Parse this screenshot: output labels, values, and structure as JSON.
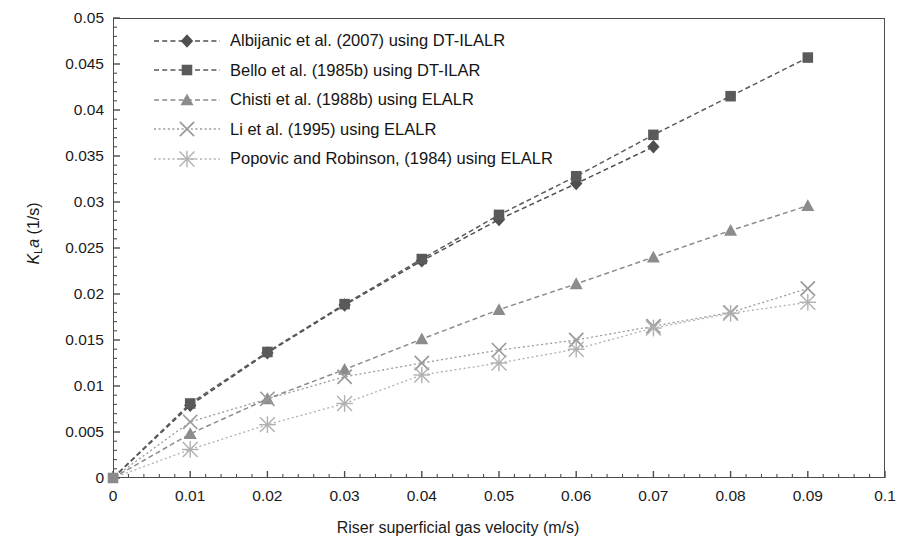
{
  "chart_data": {
    "type": "line",
    "title": "",
    "xlabel": "Riser superficial gas velocity (m/s)",
    "ylabel": "KLa (1/s)",
    "ylabel_parts": {
      "italic1": "K",
      "sub": "L",
      "italic2": "a",
      "unit": " (1/s)"
    },
    "xlim": [
      0,
      0.1
    ],
    "ylim": [
      0,
      0.05
    ],
    "xticks": [
      0,
      0.01,
      0.02,
      0.03,
      0.04,
      0.05,
      0.06,
      0.07,
      0.08,
      0.09,
      0.1
    ],
    "xtick_labels": [
      "0",
      "0.01",
      "0.02",
      "0.03",
      "0.04",
      "0.05",
      "0.06",
      "0.07",
      "0.08",
      "0.09",
      "0.1"
    ],
    "yticks": [
      0,
      0.005,
      0.01,
      0.015,
      0.02,
      0.025,
      0.03,
      0.035,
      0.04,
      0.045,
      0.05
    ],
    "ytick_labels": [
      "0",
      "0.005",
      "0.01",
      "0.015",
      "0.02",
      "0.025",
      "0.03",
      "0.035",
      "0.04",
      "0.045",
      "0.05"
    ],
    "x_minor_ticks_per_major": 5,
    "y_minor_ticks_per_major": 5,
    "grid": false,
    "legend_position": "top-left-inside",
    "series": [
      {
        "name": "Albijanic et al. (2007) using DT-ILALR",
        "marker": "diamond",
        "color": "#4f4f4f",
        "line": "dashed",
        "x": [
          0,
          0.01,
          0.02,
          0.03,
          0.04,
          0.05,
          0.06,
          0.07
        ],
        "y": [
          0,
          0.0079,
          0.0136,
          0.0188,
          0.0236,
          0.0281,
          0.032,
          0.036
        ]
      },
      {
        "name": "Bello et al. (1985b) using DT-ILAR",
        "marker": "square",
        "color": "#5a5a5a",
        "line": "dashed",
        "x": [
          0,
          0.01,
          0.02,
          0.03,
          0.04,
          0.05,
          0.06,
          0.07,
          0.08,
          0.09
        ],
        "y": [
          0,
          0.0081,
          0.0137,
          0.0189,
          0.0238,
          0.0286,
          0.0328,
          0.0373,
          0.0415,
          0.0457
        ]
      },
      {
        "name": "Chisti et al. (1988b) using ELALR",
        "marker": "triangle",
        "color": "#8c8c8c",
        "line": "dashed",
        "x": [
          0,
          0.01,
          0.02,
          0.03,
          0.04,
          0.05,
          0.06,
          0.07,
          0.08,
          0.09
        ],
        "y": [
          0,
          0.0048,
          0.0086,
          0.0118,
          0.0151,
          0.0183,
          0.0211,
          0.024,
          0.0269,
          0.0296
        ]
      },
      {
        "name": "Li et al. (1995) using ELALR",
        "marker": "cross",
        "color": "#9a9a9a",
        "line": "dotted",
        "x": [
          0,
          0.01,
          0.02,
          0.03,
          0.04,
          0.05,
          0.06,
          0.07,
          0.08,
          0.09
        ],
        "y": [
          0,
          0.0061,
          0.0086,
          0.011,
          0.0125,
          0.0139,
          0.015,
          0.0165,
          0.018,
          0.0206
        ]
      },
      {
        "name": "Popovic and Robinson, (1984) using ELALR",
        "marker": "asterisk",
        "color": "#b0b0b0",
        "line": "dotted",
        "x": [
          0,
          0.01,
          0.02,
          0.03,
          0.04,
          0.05,
          0.06,
          0.07,
          0.08,
          0.09
        ],
        "y": [
          0,
          0.0031,
          0.0058,
          0.0081,
          0.0112,
          0.0125,
          0.014,
          0.0163,
          0.0179,
          0.0191
        ]
      }
    ]
  },
  "legend": {
    "items": [
      {
        "label": "Albijanic et al. (2007) using DT-ILALR"
      },
      {
        "label": "Bello et al. (1985b) using DT-ILAR"
      },
      {
        "label": "Chisti et al. (1988b) using ELALR"
      },
      {
        "label": "Li et al. (1995) using ELALR"
      },
      {
        "label": "Popovic and Robinson, (1984) using ELALR"
      }
    ]
  }
}
